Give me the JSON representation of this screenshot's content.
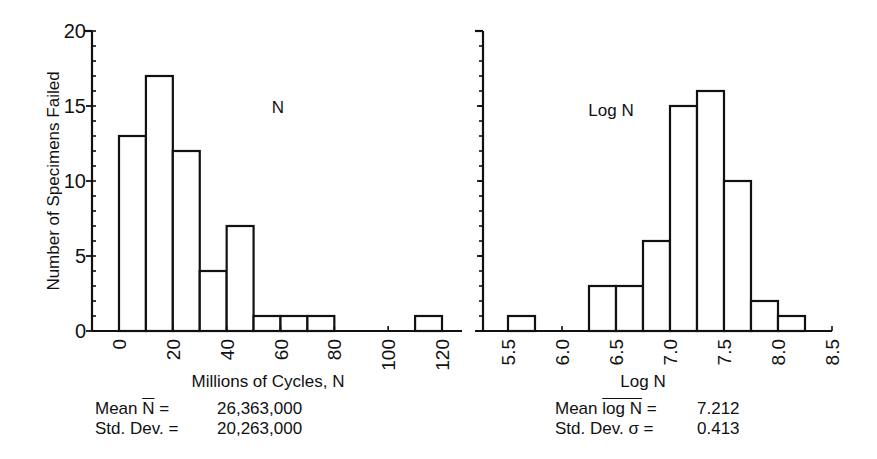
{
  "chart_data": [
    {
      "type": "bar",
      "subtype": "histogram",
      "title": "N",
      "xlabel": "Millions of Cycles, N",
      "ylabel": "Number of Specimens Failed",
      "xlim": [
        0,
        120
      ],
      "ylim": [
        0,
        20
      ],
      "xticks": [
        0,
        20,
        40,
        60,
        80,
        100,
        120
      ],
      "xtick_labels": [
        "0",
        "20",
        "40",
        "60",
        "80",
        "100",
        "120"
      ],
      "yticks": [
        0,
        5,
        10,
        15,
        20
      ],
      "ytick_labels": [
        "0",
        "5",
        "10",
        "15",
        "20"
      ],
      "bin_width": 10,
      "bins": [
        {
          "start": 0,
          "end": 10,
          "count": 13
        },
        {
          "start": 10,
          "end": 20,
          "count": 17
        },
        {
          "start": 20,
          "end": 30,
          "count": 12
        },
        {
          "start": 30,
          "end": 40,
          "count": 4
        },
        {
          "start": 40,
          "end": 50,
          "count": 7
        },
        {
          "start": 50,
          "end": 60,
          "count": 1
        },
        {
          "start": 60,
          "end": 70,
          "count": 1
        },
        {
          "start": 70,
          "end": 80,
          "count": 1
        },
        {
          "start": 80,
          "end": 90,
          "count": 0
        },
        {
          "start": 90,
          "end": 100,
          "count": 0
        },
        {
          "start": 100,
          "end": 110,
          "count": 0
        },
        {
          "start": 110,
          "end": 120,
          "count": 1
        }
      ],
      "categories": [
        "0-10",
        "10-20",
        "20-30",
        "30-40",
        "40-50",
        "50-60",
        "60-70",
        "70-80",
        "80-90",
        "90-100",
        "100-110",
        "110-120"
      ],
      "values": [
        13,
        17,
        12,
        4,
        7,
        1,
        1,
        1,
        0,
        0,
        0,
        1
      ],
      "grid": false,
      "stats": [
        {
          "label": "Mean N̄ =",
          "value": "26,363,000"
        },
        {
          "label": "Std. Dev. =",
          "value": "20,263,000"
        }
      ]
    },
    {
      "type": "bar",
      "subtype": "histogram",
      "title": "Log N",
      "xlabel": "Log N",
      "ylabel": "",
      "xlim": [
        5.25,
        8.5
      ],
      "ylim": [
        0,
        20
      ],
      "xticks": [
        5.5,
        6.0,
        6.5,
        7.0,
        7.5,
        8.0,
        8.5
      ],
      "xtick_labels": [
        "5.5",
        "6.0",
        "6.5",
        "7.0",
        "7.5",
        "8.0",
        "8.5"
      ],
      "yticks": [
        0,
        5,
        10,
        15,
        20
      ],
      "bin_width": 0.25,
      "bins": [
        {
          "start": 5.5,
          "end": 5.75,
          "count": 1
        },
        {
          "start": 5.75,
          "end": 6.0,
          "count": 0
        },
        {
          "start": 6.0,
          "end": 6.25,
          "count": 0
        },
        {
          "start": 6.25,
          "end": 6.5,
          "count": 3
        },
        {
          "start": 6.5,
          "end": 6.75,
          "count": 3
        },
        {
          "start": 6.75,
          "end": 7.0,
          "count": 6
        },
        {
          "start": 7.0,
          "end": 7.25,
          "count": 15
        },
        {
          "start": 7.25,
          "end": 7.5,
          "count": 16
        },
        {
          "start": 7.5,
          "end": 7.75,
          "count": 10
        },
        {
          "start": 7.75,
          "end": 8.0,
          "count": 2
        },
        {
          "start": 8.0,
          "end": 8.25,
          "count": 1
        }
      ],
      "categories": [
        "5.5-5.75",
        "5.75-6.0",
        "6.0-6.25",
        "6.25-6.5",
        "6.5-6.75",
        "6.75-7.0",
        "7.0-7.25",
        "7.25-7.5",
        "7.5-7.75",
        "7.75-8.0",
        "8.0-8.25"
      ],
      "values": [
        1,
        0,
        0,
        3,
        3,
        6,
        15,
        16,
        10,
        2,
        1
      ],
      "grid": false,
      "stats": [
        {
          "label": "Mean log N =",
          "value": "7.212"
        },
        {
          "label": "Std. Dev. σ =",
          "value": "0.413"
        }
      ]
    }
  ],
  "left_panel": {
    "title": "N",
    "ylabel": "Number of Specimens Failed",
    "xlabel": "Millions of Cycles, N",
    "stats": {
      "mean_label_prefix": "Mean ",
      "mean_symbol": "N",
      "mean_label_suffix": " =",
      "mean_value": "26,363,000",
      "sd_label": "Std. Dev. =",
      "sd_value": "20,263,000"
    }
  },
  "right_panel": {
    "title": "Log N",
    "xlabel": "Log N",
    "stats": {
      "mean_label_prefix": "Mean ",
      "mean_symbol": "log N",
      "mean_label_suffix": " =",
      "mean_value": "7.212",
      "sd_label": "Std. Dev. σ =",
      "sd_value": "0.413"
    }
  }
}
